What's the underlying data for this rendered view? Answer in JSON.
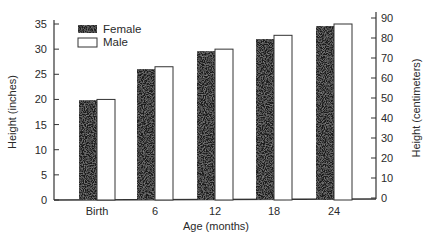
{
  "chart_data": {
    "type": "bar",
    "title": "",
    "xlabel": "Age (months)",
    "ylabel": "Height (inches)",
    "ylabel_right": "Height (centimeters)",
    "categories": [
      "Birth",
      "6",
      "12",
      "18",
      "24"
    ],
    "series": [
      {
        "name": "Female",
        "values": [
          19.75,
          26,
          29.5,
          32,
          34.5
        ],
        "color": "#1e1e1e"
      },
      {
        "name": "Male",
        "values": [
          20,
          26.5,
          30,
          32.75,
          35
        ],
        "color": "#ffffff"
      }
    ],
    "ylim": [
      0,
      35
    ],
    "yticks": [
      0,
      5,
      10,
      15,
      20,
      25,
      30,
      35
    ],
    "ylim_right": [
      0,
      90
    ],
    "yticks_right": [
      0,
      10,
      20,
      30,
      40,
      50,
      60,
      70,
      80,
      90
    ],
    "grid": false,
    "legend_position": "upper-left"
  },
  "axes": {
    "left_ticks": [
      "0",
      "5",
      "10",
      "15",
      "20",
      "25",
      "30",
      "35"
    ],
    "right_ticks": [
      "0",
      "10",
      "20",
      "30",
      "40",
      "50",
      "60",
      "70",
      "80",
      "90"
    ]
  },
  "legend": {
    "female": "Female",
    "male": "Male"
  }
}
